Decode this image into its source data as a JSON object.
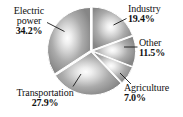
{
  "chart_data": {
    "type": "pie",
    "title": "",
    "subtitle": "",
    "xlabel": "",
    "ylabel": "",
    "legend_position": "none",
    "grid": false,
    "units": "percent",
    "labels_show_percent": true,
    "categories": [
      "Industry",
      "Other",
      "Agriculture",
      "Transportation",
      "Electric power"
    ],
    "values": [
      19.4,
      11.5,
      7.0,
      27.9,
      34.2
    ],
    "slices": [
      {
        "name": "Industry",
        "label": "Industry",
        "value": 19.4,
        "value_text": "19.4%",
        "start_angle_deg": 0,
        "end_angle_deg": 69.84,
        "fill": "#a0a0a0"
      },
      {
        "name": "Other",
        "label": "Other",
        "value": 11.5,
        "value_text": "11.5%",
        "start_angle_deg": 69.84,
        "end_angle_deg": 111.24,
        "fill": "#a8a8a8"
      },
      {
        "name": "Agriculture",
        "label": "Agriculture",
        "value": 7.0,
        "value_text": "7.0%",
        "start_angle_deg": 111.24,
        "end_angle_deg": 136.44,
        "fill": "#9c9c9c"
      },
      {
        "name": "Transportation",
        "label": "Transportation",
        "value": 27.9,
        "value_text": "27.9%",
        "start_angle_deg": 136.44,
        "end_angle_deg": 236.88,
        "fill": "#9a9a9a"
      },
      {
        "name": "Electric power",
        "label": "Electric power",
        "label_line1": "Electric",
        "label_line2": "power",
        "value": 34.2,
        "value_text": "34.2%",
        "start_angle_deg": 236.88,
        "end_angle_deg": 360,
        "fill": "#969696"
      }
    ],
    "total": 100.0,
    "style": {
      "palette": "grayscale",
      "gradient_center": "#fdfdfd",
      "gradient_edge": "#8a8a8a",
      "separator_color": "#ffffff",
      "outline_color": "#8f8f8f",
      "background": "#ffffff",
      "text_color": "#111111",
      "leader_line_color": "#1a1a1a"
    }
  }
}
